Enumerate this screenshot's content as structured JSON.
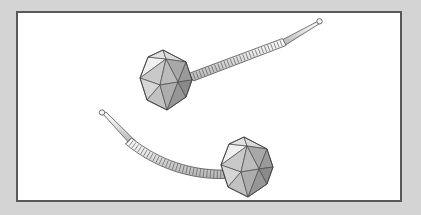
{
  "scene": {
    "title": "Bacteriophage Virus Illustration",
    "description": "Two bacteriophage particles drawn as icosahedral capsid heads attached to helically-striated contractile tails ending in tapered tips with terminal loops.",
    "background_color": "#d4d4d4",
    "canvas_color": "#ffffff",
    "frame_border_color": "#595959",
    "frame": {
      "x": 16,
      "y": 11,
      "width": 386,
      "height": 191,
      "border_width": 2
    }
  },
  "palette": {
    "outline": "#4a4a4a",
    "facet_highlight": "#f2f2f2",
    "facet_light": "#dedede",
    "facet_mid": "#bdbdbd",
    "facet_mid_dark": "#a3a3a3",
    "facet_dark": "#8c8c8c",
    "facet_darkest": "#787878",
    "tail_light": "#ededed",
    "tail_mid": "#cfcfcf",
    "coil_stroke": "#5a5a5a"
  },
  "phages": [
    {
      "id": "phage-upper",
      "label": "Upper bacteriophage",
      "head": {
        "label": "Icosahedral capsid head",
        "center_x": 167,
        "center_y": 84,
        "radius": 30,
        "facet_count": 20,
        "visible_facet_count": 9
      },
      "tail": {
        "label": "Contractile helical tail",
        "attach_x": 192,
        "attach_y": 71,
        "tip_x": 322,
        "tip_y": 22,
        "curvature": "straight",
        "coil_band_count": 30,
        "tip_loop_radius": 2.6
      }
    },
    {
      "id": "phage-lower",
      "label": "Lower bacteriophage",
      "head": {
        "label": "Icosahedral capsid head",
        "center_x": 248,
        "center_y": 171,
        "radius": 30,
        "facet_count": 20,
        "visible_facet_count": 9
      },
      "tail": {
        "label": "Contractile helical tail",
        "attach_x": 222,
        "attach_y": 172,
        "tip_x": 100,
        "tip_y": 113,
        "curvature": "arced-downward",
        "coil_band_count": 30,
        "tip_loop_radius": 2.6
      }
    }
  ]
}
